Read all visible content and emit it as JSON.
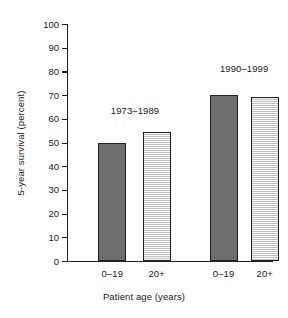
{
  "chart_data": {
    "type": "bar",
    "title": "",
    "subtitle": "",
    "xlabel": "Patient age (years)",
    "ylabel": "5-year survival (percent)",
    "ylim": [
      0,
      100
    ],
    "xlim": [
      0,
      4
    ],
    "grid": false,
    "legend_position": "none",
    "y_ticks": [
      0,
      10,
      20,
      30,
      40,
      50,
      60,
      70,
      80,
      90,
      100
    ],
    "y_tick_labels": [
      "0",
      "10",
      "20",
      "30",
      "40",
      "50",
      "60",
      "70",
      "80",
      "90",
      "100"
    ],
    "categories": [
      "0–19",
      "20+",
      "0–19",
      "20+"
    ],
    "values": [
      50,
      54.5,
      70,
      69
    ],
    "bar_styles": [
      "dark",
      "light",
      "dark",
      "light"
    ],
    "groups": [
      {
        "label": "1973–1989",
        "categories": [
          "0–19",
          "20+"
        ],
        "values": [
          50,
          54.5
        ]
      },
      {
        "label": "1990–1999",
        "categories": [
          "0–19",
          "20+"
        ],
        "values": [
          70,
          69
        ]
      }
    ],
    "annotations": [
      {
        "text": "1973–1989",
        "value": 61
      },
      {
        "text": "1990–1999",
        "value": 79
      }
    ],
    "colors": {
      "dark_bar": "#6e6e6e",
      "light_bar": "#d9d9d9",
      "bar_border": "#231f20",
      "axis": "#231f20",
      "text": "#1a1a1a",
      "background": "#ffffff"
    }
  },
  "bars": [
    {
      "label": "0–19",
      "value": 50,
      "style": "dark",
      "center_pct": 22.0,
      "width_px": 28
    },
    {
      "label": "20+",
      "value": 54.5,
      "style": "light",
      "center_pct": 43.5,
      "width_px": 28
    },
    {
      "label": "0–19",
      "value": 70,
      "style": "dark",
      "center_pct": 76.0,
      "width_px": 28
    },
    {
      "label": "20+",
      "value": 69,
      "style": "light",
      "center_pct": 96.0,
      "width_px": 28
    }
  ],
  "annotations": [
    {
      "label": "1973–1989",
      "center_pct": 33.0,
      "value": 61
    },
    {
      "label": "1990–1999",
      "center_pct": 86.0,
      "value": 79
    }
  ],
  "axes": {
    "y_title": "5-year survival (percent)",
    "x_title": "Patient age (years)",
    "y_ticks": [
      {
        "label": "100",
        "value": 100
      },
      {
        "label": "90",
        "value": 90
      },
      {
        "label": "80",
        "value": 80
      },
      {
        "label": "70",
        "value": 70
      },
      {
        "label": "60",
        "value": 60
      },
      {
        "label": "50",
        "value": 50
      },
      {
        "label": "40",
        "value": 40
      },
      {
        "label": "30",
        "value": 30
      },
      {
        "label": "20",
        "value": 20
      },
      {
        "label": "10",
        "value": 10
      },
      {
        "label": "0",
        "value": 0
      }
    ]
  }
}
